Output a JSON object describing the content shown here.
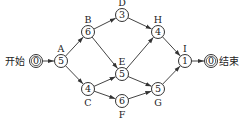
{
  "diagram": {
    "type": "activity-network",
    "start_label": "开始",
    "end_label": "结束",
    "nodes": [
      {
        "id": "start",
        "value": "0",
        "label": "",
        "x": 36,
        "y": 61,
        "double": true
      },
      {
        "id": "A",
        "value": "5",
        "label": "A",
        "x": 61,
        "y": 61,
        "label_pos": "above"
      },
      {
        "id": "B",
        "value": "6",
        "label": "B",
        "x": 88,
        "y": 32,
        "label_pos": "above"
      },
      {
        "id": "C",
        "value": "4",
        "label": "C",
        "x": 88,
        "y": 89,
        "label_pos": "below"
      },
      {
        "id": "D",
        "value": "3",
        "label": "D",
        "x": 122,
        "y": 15,
        "label_pos": "above"
      },
      {
        "id": "E",
        "value": "5",
        "label": "E",
        "x": 122,
        "y": 74,
        "label_pos": "above"
      },
      {
        "id": "F",
        "value": "6",
        "label": "F",
        "x": 122,
        "y": 101,
        "label_pos": "below"
      },
      {
        "id": "H",
        "value": "4",
        "label": "H",
        "x": 158,
        "y": 32,
        "label_pos": "above"
      },
      {
        "id": "G",
        "value": "5",
        "label": "G",
        "x": 158,
        "y": 89,
        "label_pos": "below"
      },
      {
        "id": "I",
        "value": "1",
        "label": "I",
        "x": 185,
        "y": 61,
        "label_pos": "above"
      },
      {
        "id": "end",
        "value": "0",
        "label": "",
        "x": 211,
        "y": 61,
        "double": true
      }
    ],
    "edges": [
      [
        "start",
        "A"
      ],
      [
        "A",
        "B"
      ],
      [
        "A",
        "C"
      ],
      [
        "B",
        "D"
      ],
      [
        "B",
        "E"
      ],
      [
        "C",
        "E"
      ],
      [
        "C",
        "F"
      ],
      [
        "D",
        "H"
      ],
      [
        "E",
        "H"
      ],
      [
        "E",
        "G"
      ],
      [
        "F",
        "G"
      ],
      [
        "H",
        "I"
      ],
      [
        "G",
        "I"
      ],
      [
        "I",
        "end"
      ]
    ]
  }
}
